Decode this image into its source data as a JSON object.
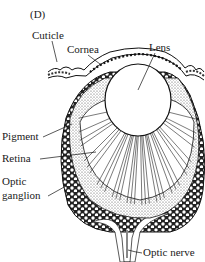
{
  "figure": {
    "panel_label": "(D)",
    "labels": {
      "cuticle": "Cuticle",
      "cornea": "Cornea",
      "lens": "Lens",
      "pigment": "Pigment",
      "retina": "Retina",
      "optic_ganglion_line1": "Optic",
      "optic_ganglion_line2": "ganglion",
      "optic_nerve": "Optic nerve"
    }
  },
  "colors": {
    "ink": "#1a1a1a",
    "paper": "#ffffff",
    "stipple": "#bdbdbd"
  }
}
